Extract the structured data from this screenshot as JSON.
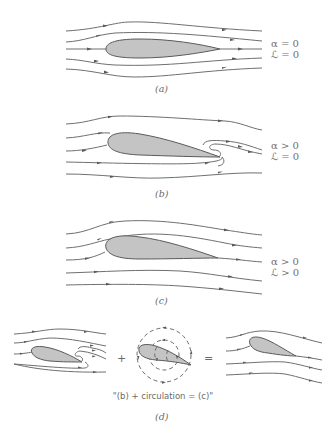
{
  "figure": {
    "colors": {
      "background": "#ffffff",
      "streamline": "#6f6f6f",
      "airfoil_fill": "#c4c4c4",
      "airfoil_stroke": "#5a5a5a",
      "text": "#6a6a6a"
    },
    "panels": [
      {
        "id": "a",
        "caption": "(a)",
        "conditions": [
          "α = 0",
          "ℒ = 0"
        ],
        "description": "Symmetric flow, zero angle of attack, no lift"
      },
      {
        "id": "b",
        "caption": "(b)",
        "conditions": [
          "α > 0",
          "ℒ = 0"
        ],
        "description": "Inviscid flow at angle of attack with rear stagnation point on upper surface; flow wraps around sharp trailing edge"
      },
      {
        "id": "c",
        "caption": "(c)",
        "conditions": [
          "α > 0",
          "ℒ > 0"
        ],
        "description": "Flow leaves trailing edge smoothly (Kutta condition), producing lift"
      },
      {
        "id": "d",
        "caption": "(d)",
        "plus": "+",
        "equals": "=",
        "equation": "\"(b) + circulation = (c)\"",
        "description": "Superposition of flow (b) with circulation yields flow (c)"
      }
    ]
  }
}
